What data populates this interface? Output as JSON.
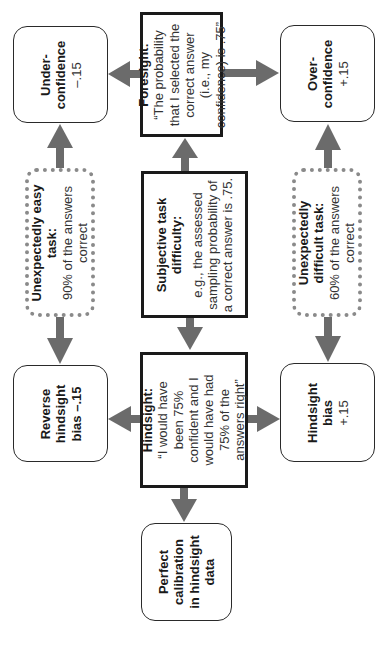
{
  "orientation": "rotated-90-ccw",
  "colors": {
    "arrow": "#6b6b6b",
    "box_border": "#1a1a1a",
    "dotted_border": "#8a8a8a",
    "text": "#1a1a1a"
  },
  "nodes": {
    "foresight": {
      "title": "Foresight:",
      "lines": [
        "“The probability",
        "that I selected the",
        "correct answer",
        "(i.e., my",
        "confidence) is .75”"
      ]
    },
    "subjective": {
      "title_lines": [
        "Subjective task",
        "difficulty:"
      ],
      "lines": [
        "e.g., the assessed",
        "sampling probability of",
        "a correct answer is .75."
      ]
    },
    "hindsight": {
      "title": "Hindsight:",
      "lines": [
        "“I would have",
        "been 75%",
        "confident and I",
        "would have had",
        "75% of the",
        "answers right”"
      ]
    },
    "underconfidence": {
      "title_lines": [
        "Under-",
        "confidence"
      ],
      "value": "–.15"
    },
    "overconfidence": {
      "title_lines": [
        "Over-",
        "confidence"
      ],
      "value": "+.15"
    },
    "easy_task": {
      "title_lines": [
        "Unexpectedly easy",
        "task:"
      ],
      "lines": [
        "90% of the answers",
        "correct"
      ]
    },
    "difficult_task": {
      "title_lines": [
        "Unexpectedly",
        "difficult task:"
      ],
      "lines": [
        "60% of the answers",
        "correct"
      ]
    },
    "reverse_hindsight": {
      "title_lines": [
        "Reverse",
        "hindsight",
        "bias –.15"
      ]
    },
    "hindsight_bias": {
      "title_lines": [
        "Hindsight",
        "bias"
      ],
      "value": "+.15"
    },
    "perfect_calibration": {
      "title_lines": [
        "Perfect",
        "calibration",
        "in hindsight",
        "data"
      ]
    }
  },
  "edges": [
    {
      "from": "subjective",
      "to": "foresight"
    },
    {
      "from": "subjective",
      "to": "hindsight"
    },
    {
      "from": "foresight",
      "to": "underconfidence"
    },
    {
      "from": "foresight",
      "to": "overconfidence"
    },
    {
      "from": "easy_task",
      "to": "underconfidence"
    },
    {
      "from": "easy_task",
      "to": "reverse_hindsight"
    },
    {
      "from": "difficult_task",
      "to": "overconfidence"
    },
    {
      "from": "difficult_task",
      "to": "hindsight_bias"
    },
    {
      "from": "hindsight",
      "to": "reverse_hindsight"
    },
    {
      "from": "hindsight",
      "to": "hindsight_bias"
    },
    {
      "from": "hindsight",
      "to": "perfect_calibration"
    }
  ]
}
